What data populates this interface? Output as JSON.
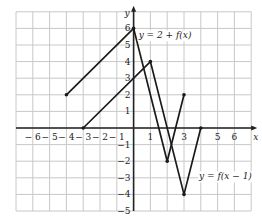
{
  "chart_data": {
    "type": "line",
    "title": "",
    "xlabel": "x",
    "ylabel": "y",
    "xlim": [
      -7,
      7
    ],
    "ylim": [
      -5,
      7
    ],
    "grid": true,
    "x_ticks": [
      -6,
      -5,
      -4,
      -3,
      -2,
      -1,
      1,
      3,
      5,
      6
    ],
    "y_ticks": [
      -5,
      -4,
      -3,
      -2,
      -1,
      1,
      2,
      3,
      4,
      5,
      6
    ],
    "series": [
      {
        "name": "y = 2 + f(x)",
        "points": [
          [
            -4,
            2
          ],
          [
            0,
            6
          ],
          [
            2,
            -2
          ],
          [
            3,
            2
          ]
        ]
      },
      {
        "name": "y = f(x − 1)",
        "points": [
          [
            -3,
            0
          ],
          [
            1,
            4
          ],
          [
            3,
            -4
          ],
          [
            4,
            0
          ]
        ]
      }
    ],
    "annotations": [
      {
        "text": "y = 2 + f(x)",
        "x": 0.3,
        "y": 5.4
      },
      {
        "text": "y = f(x − 1)",
        "x": 3.9,
        "y": -3.1
      }
    ]
  },
  "colors": {
    "grid": "#c8c8c8",
    "axis": "#222222",
    "curve": "#1a1a1a"
  }
}
